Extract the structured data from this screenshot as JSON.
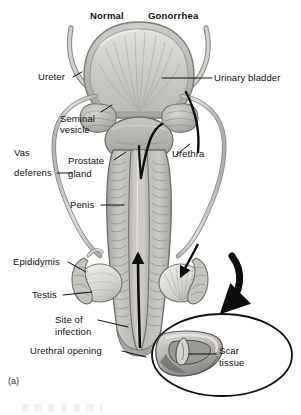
{
  "figure": {
    "caption_marker": "(a)",
    "panel_titles": {
      "left": "Normal",
      "right": "Gonorrhea"
    }
  },
  "labels": {
    "ureter": "Ureter",
    "seminal_vesicle": "Seminal\nvesicle",
    "seminal_vesicle_l1": "Seminal",
    "seminal_vesicle_l2": "vesicle",
    "vas_deferens_l1": "Vas",
    "vas_deferens_l2": "deferens",
    "prostate_gland_l1": "Prostate",
    "prostate_gland_l2": "gland",
    "penis": "Penis",
    "epididymis": "Epididymis",
    "testis": "Testis",
    "site_of_infection_l1": "Site of",
    "site_of_infection_l2": "infection",
    "urethral_opening": "Urethral opening",
    "urinary_bladder": "Urinary bladder",
    "urethra": "Urethra",
    "scar_tissue_l1": "Scar",
    "scar_tissue_l2": "tissue"
  },
  "colors": {
    "background": "#ffffff",
    "ink": "#111111",
    "leader_line": "#1a1a1a",
    "tissue_light": "#d8d6d2",
    "tissue_mid": "#b9b7b2",
    "tissue_dark": "#8e8c88",
    "tissue_darker": "#6e6c68",
    "bladder_fill": "#cfcfcd",
    "bladder_wall": "#a9a7a2",
    "tube_fill": "#d9d7d3",
    "tube_stroke": "#8a8884",
    "arrow_black": "#0d0d0d",
    "inset_outline": "#111111"
  },
  "inset": {
    "shape": "ellipse",
    "contents": "cross-section of urethra showing scar tissue constriction"
  }
}
